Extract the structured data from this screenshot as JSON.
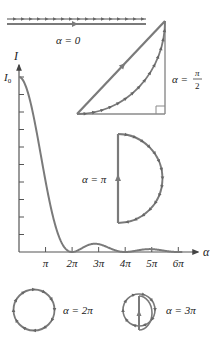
{
  "figure": {
    "colors": {
      "line": "#7a7a7a",
      "phasor": "#808080",
      "axis": "#555555",
      "text": "#222222"
    }
  },
  "labels": {
    "alpha0": "α = 0",
    "alphaHalfPi_left": "α =",
    "alphaHalfPi_num": "π",
    "alphaHalfPi_den": "2",
    "alphaPi": "α = π",
    "alpha2Pi": "α = 2π",
    "alpha3Pi": "α = 3π",
    "yAxis": "I",
    "yMax": "I",
    "yMaxSub": "0",
    "xAxis": "α"
  },
  "chart_data": {
    "type": "line",
    "title": "",
    "xlabel": "α",
    "ylabel": "I",
    "function": "I = I0 * (sin(α/2)/(α/2))^2",
    "x_ticks": [
      "π",
      "2π",
      "3π",
      "4π",
      "5π",
      "6π"
    ],
    "y_ticks_count": 10,
    "y_max_label": "I0",
    "xlim": [
      0,
      6.8
    ],
    "ylim": [
      0,
      1
    ],
    "grid": false,
    "series": [
      {
        "name": "Intensity",
        "x_in_pi": [
          0,
          0.5,
          1,
          1.5,
          2,
          2.5,
          3,
          3.5,
          4,
          4.5,
          5,
          5.5,
          6
        ],
        "values": [
          1.0,
          0.81,
          0.405,
          0.09,
          0.0,
          0.032,
          0.045,
          0.017,
          0.0,
          0.01,
          0.016,
          0.007,
          0.0
        ]
      }
    ]
  }
}
